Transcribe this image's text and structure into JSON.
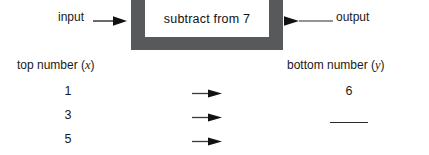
{
  "machine": {
    "input_label": "input",
    "box_label": "subtract from 7",
    "output_label": "output",
    "input_arrow_icon": "right-arrow-icon",
    "output_arrow_icon": "right-arrow-icon",
    "frame_color": "#58595b",
    "inner_color": "#ffffff"
  },
  "table": {
    "left_header": "top number (",
    "left_header_var": "x",
    "left_header_close": ")",
    "right_header": "bottom number (",
    "right_header_var": "y",
    "right_header_close": ")",
    "rows": [
      {
        "input": "1",
        "arrow_icon": "right-arrow-icon",
        "output": "6",
        "output_is_blank": false
      },
      {
        "input": "3",
        "arrow_icon": "right-arrow-icon",
        "output": "",
        "output_is_blank": true
      },
      {
        "input": "5",
        "arrow_icon": "right-arrow-icon",
        "output": "",
        "output_is_blank": false
      }
    ]
  }
}
